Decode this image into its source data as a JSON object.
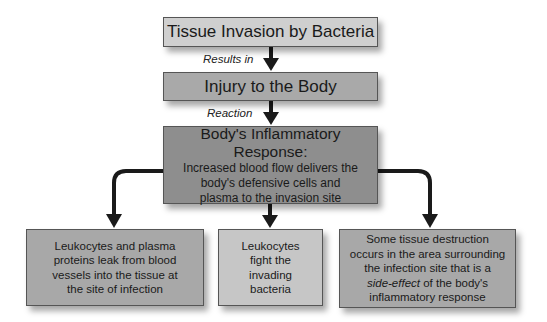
{
  "diagram": {
    "type": "flowchart",
    "nodes": {
      "invasion": {
        "label": "Tissue Invasion by Bacteria"
      },
      "injury": {
        "label": "Injury to the Body"
      },
      "response": {
        "title": "Body's Inflammatory Response:",
        "lines": [
          "Increased blood flow delivers the",
          "body's defensive cells and",
          "plasma to the invasion site"
        ]
      },
      "leak": {
        "lines": [
          "Leukocytes and plasma",
          "proteins leak from blood",
          "vessels into the tissue at",
          "the site of infection"
        ]
      },
      "fight": {
        "lines": [
          "Leukocytes",
          "fight the",
          "invading",
          "bacteria"
        ]
      },
      "destruction": {
        "lines": [
          "Some tissue destruction",
          "occurs in the area surrounding",
          "the infection site that is a"
        ],
        "italic_part": "side-effect",
        "line4_rest": " of the body's",
        "line5": "inflammatory response"
      }
    },
    "edges": {
      "e1": {
        "label": "Results in"
      },
      "e2": {
        "label": "Reaction"
      }
    },
    "colors": {
      "light_box": "#cfcfcf",
      "mid_box": "#a9a9a9",
      "dark_box": "#8e8e8e",
      "arrow": "#1a1a1a"
    }
  }
}
